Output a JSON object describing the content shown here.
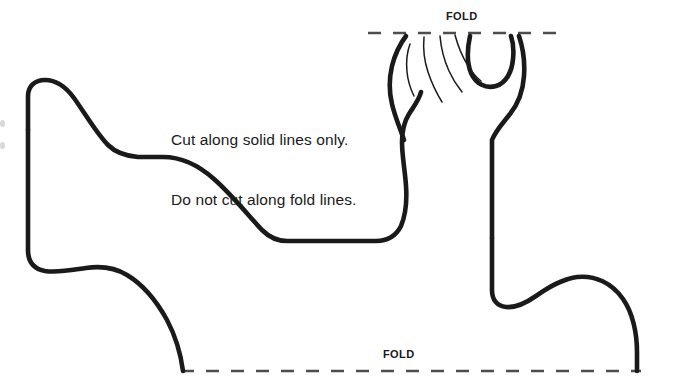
{
  "document": {
    "type": "cut-out-craft-template",
    "subject": "foot-paw-silhouette",
    "background_color": "#ffffff",
    "ink_color": "#1a1a1a"
  },
  "instructions": {
    "line1": "Cut along solid lines only.",
    "line2": "Do not cut along fold lines."
  },
  "fold_lines": {
    "top": {
      "label": "FOLD",
      "y": 33,
      "x_start": 368,
      "x_end": 561,
      "dash_color": "#4d4d4d"
    },
    "bottom": {
      "label": "FOLD",
      "y": 371,
      "x_start": 181,
      "x_end": 641,
      "dash_color": "#4d4d4d"
    }
  },
  "cut_outline": {
    "stroke_color": "#1a1a1a",
    "description": "Solid cut line forming the foot and leg silhouette"
  },
  "toe_creases": {
    "count": 4,
    "stroke_color": "#1a1a1a",
    "description": "Thin curved lines separating the toes"
  }
}
